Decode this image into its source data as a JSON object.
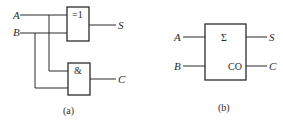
{
  "diagram_a": {
    "caption": "(a)",
    "inputs": [
      "A",
      "B"
    ],
    "xor_gate": {
      "symbol": "=1",
      "output": "S"
    },
    "and_gate": {
      "symbol": "&",
      "output": "C"
    }
  },
  "diagram_b": {
    "caption": "(b)",
    "inputs": [
      "A",
      "B"
    ],
    "block": {
      "sum_symbol": "Σ",
      "carry_symbol": "CO"
    },
    "outputs": [
      "S",
      "C"
    ]
  }
}
